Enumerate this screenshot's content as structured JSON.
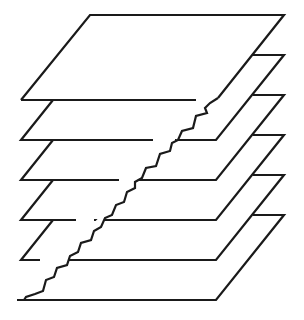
{
  "diagram": {
    "title": "",
    "stroke_color": "#1a1a1a",
    "background_color": "#ffffff",
    "layer_count": 6,
    "layers": [
      {
        "index": 1,
        "bottom_y": 100
      },
      {
        "index": 2,
        "bottom_y": 140
      },
      {
        "index": 3,
        "bottom_y": 180
      },
      {
        "index": 4,
        "bottom_y": 220
      },
      {
        "index": 5,
        "bottom_y": 260
      },
      {
        "index": 6,
        "bottom_y": 300
      }
    ],
    "labels": []
  }
}
